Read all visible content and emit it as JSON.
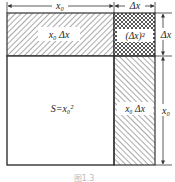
{
  "diagram": {
    "top_dimension": {
      "left_label": "x₀",
      "right_label": "Δx"
    },
    "right_dimension": {
      "top_label": "Δx",
      "bottom_label": "x₀"
    },
    "regions": {
      "main_square": "S=x₀²",
      "top_strip": "x₀ Δx",
      "corner_square": "(Δx)²",
      "right_strip": "x₀ Δx"
    },
    "caption": "图1.3",
    "colors": {
      "stroke": "#333333",
      "hatch": "#555555",
      "background": "#ffffff"
    }
  }
}
